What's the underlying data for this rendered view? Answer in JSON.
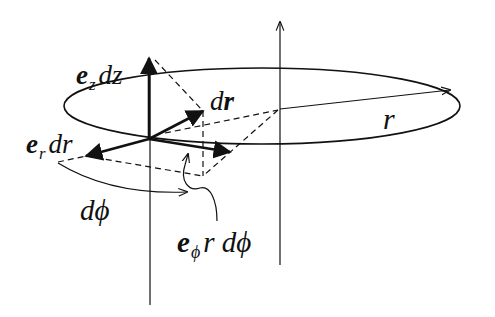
{
  "diagram": {
    "labels": {
      "ez_dz": {
        "vec": "e",
        "sub": "z",
        "rest": "dz"
      },
      "dr_vec": {
        "d": "d",
        "vec": "r"
      },
      "r": "r",
      "er_dr": {
        "vec": "e",
        "sub": "r",
        "rest": "dr"
      },
      "dphi": "dϕ",
      "ephi_rdphi": {
        "vec": "e",
        "sub": "ϕ",
        "rest": "r dϕ"
      }
    },
    "colors": {
      "stroke": "#111111",
      "background": "#ffffff"
    }
  }
}
